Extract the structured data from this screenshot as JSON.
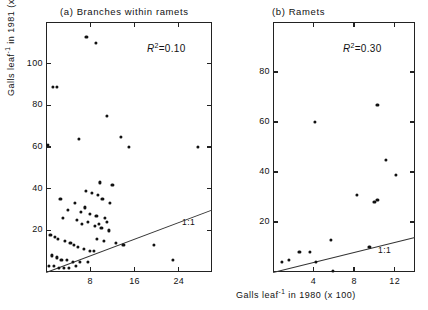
{
  "figure": {
    "xlabel": "Galls leaf",
    "xlabel_sup": "-1",
    "xlabel_rest": " in 1980 (x 100)",
    "ylabel": "Galls leaf",
    "ylabel_sup": "-1",
    "ylabel_rest": " in 1981 (x100)",
    "background": "#ffffff",
    "point_color": "#111111",
    "line_color": "#333333"
  },
  "chart_data": [
    {
      "type": "scatter",
      "panel": "a",
      "title": "(a)  Branches within ramets",
      "annotation": "R2=0.10",
      "r2_value": 0.1,
      "xlabel": "Galls leaf-1 in 1980 (x 100)",
      "ylabel": "Galls leaf-1 in 1981 (x100)",
      "xlim": [
        0,
        30
      ],
      "ylim": [
        0,
        120
      ],
      "xticks": [
        8,
        16,
        24
      ],
      "yticks": [
        20,
        40,
        60,
        80,
        100
      ],
      "grid": false,
      "reference_line": {
        "label": "1:1",
        "slope": 1,
        "intercept": 0
      },
      "x": [
        1.2,
        2.0,
        7.3,
        9.0,
        0.3,
        6.0,
        11.0,
        13.5,
        15.0,
        27.5,
        9.8,
        12.0,
        7.2,
        2.6,
        5.2,
        8.3,
        9.4,
        10.2,
        11.5,
        7.0,
        4.0,
        6.3,
        8.0,
        9.1,
        10.6,
        11.0,
        6.5,
        8.8,
        10.0,
        11.3,
        3.0,
        5.6,
        7.6,
        9.6,
        0.8,
        1.6,
        2.2,
        3.4,
        4.4,
        5.0,
        5.8,
        6.8,
        7.9,
        8.6,
        9.2,
        10.4,
        12.6,
        14.0,
        19.5,
        23.0,
        1.0,
        1.9,
        2.8,
        3.8,
        4.8,
        6.1,
        7.5,
        0.5,
        1.4,
        2.4,
        3.2,
        4.2,
        5.4
      ],
      "y": [
        89,
        89,
        113,
        110,
        61,
        64,
        75,
        65,
        60,
        60,
        43,
        42,
        39,
        35,
        33,
        38,
        37,
        35,
        33,
        31,
        30,
        29,
        28,
        27,
        26,
        24,
        23,
        22,
        21,
        20,
        26,
        25,
        24,
        23,
        18,
        17,
        16,
        15,
        14,
        13,
        12,
        11,
        10,
        10,
        16,
        15,
        14,
        13,
        13,
        6,
        8,
        7,
        6,
        6,
        5,
        5,
        5,
        3,
        3,
        2,
        2,
        2,
        3
      ],
      "n_points": 63
    },
    {
      "type": "scatter",
      "panel": "b",
      "title": "(b)  Ramets",
      "annotation": "R2=0.30",
      "r2_value": 0.3,
      "xlabel": "Galls leaf-1 in 1980 (x 100)",
      "ylabel": "Galls leaf-1 in 1981 (x100)",
      "xlim": [
        0,
        14
      ],
      "ylim": [
        0,
        100
      ],
      "xticks": [
        4,
        8,
        12
      ],
      "yticks": [
        20,
        40,
        60,
        80
      ],
      "grid": false,
      "reference_line": {
        "label": "1:1",
        "slope": 1,
        "intercept": 0
      },
      "x": [
        4.1,
        10.3,
        11.1,
        12.1,
        10.3,
        8.3,
        10.0,
        5.7,
        9.5,
        2.6,
        3.6,
        0.9,
        1.6,
        4.2,
        5.9
      ],
      "y": [
        60,
        67,
        45,
        39,
        29,
        31,
        28,
        13,
        10,
        8,
        8,
        4,
        5,
        4,
        0.5
      ],
      "n_points": 15
    }
  ],
  "panel_a": {
    "title": "(a)  Branches within ramets",
    "r2_prefix": "R",
    "r2_sup": "2",
    "r2_text": "=0.10",
    "oneone": "1:1",
    "yticks": [
      "100",
      "80",
      "60",
      "40",
      "20"
    ],
    "xticks": [
      "8",
      "16",
      "24"
    ]
  },
  "panel_b": {
    "title": "(b)  Ramets",
    "r2_prefix": "R",
    "r2_sup": "2",
    "r2_text": "=0.30",
    "oneone": "1:1",
    "yticks": [
      "80",
      "60",
      "40",
      "20"
    ],
    "xticks": [
      "4",
      "8",
      "12"
    ]
  }
}
